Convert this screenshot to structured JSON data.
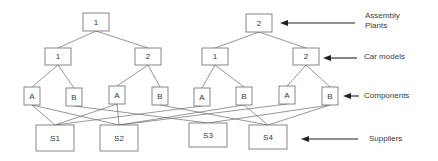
{
  "diagram": {
    "plants": [
      {
        "id": "P1",
        "label": "1",
        "x": 83,
        "y": 13,
        "w": 26,
        "h": 18
      },
      {
        "id": "P2",
        "label": "2",
        "x": 246,
        "y": 14,
        "w": 26,
        "h": 18
      }
    ],
    "car_models": [
      {
        "id": "C11",
        "label": "1",
        "plant": "P1",
        "x": 45,
        "y": 48,
        "w": 26,
        "h": 17
      },
      {
        "id": "C12",
        "label": "2",
        "plant": "P1",
        "x": 135,
        "y": 48,
        "w": 26,
        "h": 17
      },
      {
        "id": "C21",
        "label": "1",
        "plant": "P2",
        "x": 202,
        "y": 48,
        "w": 26,
        "h": 17
      },
      {
        "id": "C22",
        "label": "2",
        "plant": "P2",
        "x": 293,
        "y": 48,
        "w": 26,
        "h": 17
      }
    ],
    "components": [
      {
        "id": "K1",
        "label": "A",
        "car": "C11",
        "x": 24,
        "y": 87,
        "w": 16,
        "h": 18
      },
      {
        "id": "K2",
        "label": "B",
        "car": "C11",
        "x": 66,
        "y": 88,
        "w": 16,
        "h": 18
      },
      {
        "id": "K3",
        "label": "A",
        "car": "C12",
        "x": 109,
        "y": 86,
        "w": 16,
        "h": 18
      },
      {
        "id": "K4",
        "label": "B",
        "car": "C12",
        "x": 152,
        "y": 87,
        "w": 16,
        "h": 18
      },
      {
        "id": "K5",
        "label": "A",
        "car": "C21",
        "x": 194,
        "y": 88,
        "w": 16,
        "h": 18
      },
      {
        "id": "K6",
        "label": "B",
        "car": "C21",
        "x": 236,
        "y": 87,
        "w": 16,
        "h": 18
      },
      {
        "id": "K7",
        "label": "A",
        "car": "C22",
        "x": 279,
        "y": 86,
        "w": 16,
        "h": 18
      },
      {
        "id": "K8",
        "label": "B",
        "car": "C22",
        "x": 322,
        "y": 87,
        "w": 16,
        "h": 18
      }
    ],
    "suppliers": [
      {
        "id": "S1",
        "label": "S1",
        "x": 36,
        "y": 125,
        "w": 38,
        "h": 26
      },
      {
        "id": "S2",
        "label": "S2",
        "x": 100,
        "y": 125,
        "w": 38,
        "h": 26
      },
      {
        "id": "S3",
        "label": "S3",
        "x": 189,
        "y": 123,
        "w": 38,
        "h": 24
      },
      {
        "id": "S4",
        "label": "S4",
        "x": 249,
        "y": 125,
        "w": 38,
        "h": 24
      }
    ],
    "component_supplier_edges": [
      [
        "K1",
        "S1"
      ],
      [
        "K1",
        "S2"
      ],
      [
        "K2",
        "S3"
      ],
      [
        "K3",
        "S1"
      ],
      [
        "K3",
        "S2"
      ],
      [
        "K4",
        "S4"
      ],
      [
        "K5",
        "S1"
      ],
      [
        "K6",
        "S2"
      ],
      [
        "K6",
        "S4"
      ],
      [
        "K7",
        "S2"
      ],
      [
        "K8",
        "S3"
      ],
      [
        "K8",
        "S4"
      ]
    ],
    "level_labels": [
      {
        "id": "plants",
        "lines": [
          "Assembly",
          "Plants"
        ],
        "text_x": 365,
        "text_y": 18,
        "arrow_from": 355,
        "arrow_to": 280,
        "arrow_y": 23
      },
      {
        "id": "cars",
        "lines": [
          "Car models"
        ],
        "text_x": 364,
        "text_y": 59,
        "arrow_from": 357,
        "arrow_to": 323,
        "arrow_y": 58
      },
      {
        "id": "components",
        "lines": [
          "Components"
        ],
        "text_x": 364,
        "text_y": 98,
        "arrow_from": 359,
        "arrow_to": 343,
        "arrow_y": 96
      },
      {
        "id": "suppliers",
        "lines": [
          "Suppliers"
        ],
        "text_x": 369,
        "text_y": 141,
        "arrow_from": 358,
        "arrow_to": 301,
        "arrow_y": 139
      }
    ]
  }
}
